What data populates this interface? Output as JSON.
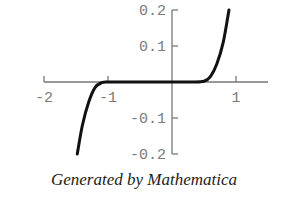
{
  "chart_data": {
    "type": "line",
    "title": "",
    "xlabel": "",
    "ylabel": "",
    "xlim": [
      -2.0,
      1.5
    ],
    "ylim": [
      -0.2,
      0.2
    ],
    "x_ticks": [
      -2,
      -1,
      1
    ],
    "x_tick_labels": [
      "-2",
      "-1",
      "1"
    ],
    "y_ticks": [
      0.2,
      0.1,
      -0.1,
      -0.2
    ],
    "y_tick_labels": [
      "0.2",
      "0.1",
      "-0.1",
      "-0.2"
    ],
    "grid": false,
    "legend": null,
    "series": [
      {
        "name": "f(x)",
        "x": [
          -1.48,
          -1.4,
          -1.3,
          -1.2,
          -1.1,
          -1.0,
          -0.8,
          -0.5,
          0.0,
          0.3,
          0.5,
          0.6,
          0.7,
          0.8,
          0.89
        ],
        "y": [
          -0.2,
          -0.12,
          -0.055,
          -0.015,
          -0.002,
          0.0,
          0.0,
          0.0,
          0.0,
          0.0,
          0.002,
          0.015,
          0.05,
          0.11,
          0.2
        ]
      }
    ]
  },
  "caption": "Generated by Mathematica"
}
